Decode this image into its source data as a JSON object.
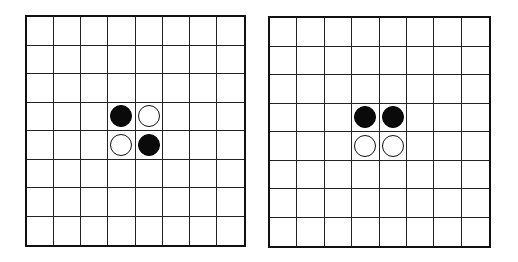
{
  "boards": [
    {
      "id": "board-left",
      "rows": 8,
      "cols": 8,
      "discs": [
        {
          "row": 3,
          "col": 3,
          "color": "black"
        },
        {
          "row": 3,
          "col": 4,
          "color": "white"
        },
        {
          "row": 4,
          "col": 3,
          "color": "white"
        },
        {
          "row": 4,
          "col": 4,
          "color": "black"
        }
      ]
    },
    {
      "id": "board-right",
      "rows": 8,
      "cols": 8,
      "discs": [
        {
          "row": 3,
          "col": 3,
          "color": "black"
        },
        {
          "row": 3,
          "col": 4,
          "color": "black"
        },
        {
          "row": 4,
          "col": 3,
          "color": "white"
        },
        {
          "row": 4,
          "col": 4,
          "color": "white"
        }
      ]
    }
  ],
  "colors": {
    "black": "#0a0a0a",
    "white": "#ffffff",
    "grid": "#222222"
  }
}
